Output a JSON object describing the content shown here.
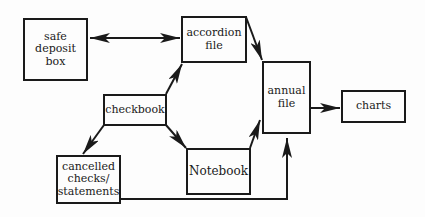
{
  "nodes": {
    "safe_deposit_box": {
      "label": "safe\ndeposit\nbox"
    },
    "accordion_file": {
      "label": "accordion\nfile"
    },
    "checkbook": {
      "label": "checkbook"
    },
    "cancelled_checks": {
      "label": "cancelled\nchecks/\nstatements"
    },
    "notebook": {
      "label": "Notebook"
    },
    "annual_file": {
      "label": "annual\nfile"
    },
    "charts": {
      "label": "charts"
    }
  },
  "edges": [
    {
      "from": "safe deposit box",
      "to": "accordion file",
      "bidirectional": true
    },
    {
      "from": "checkbook",
      "to": "accordion file"
    },
    {
      "from": "checkbook",
      "to": "cancelled checks/statements"
    },
    {
      "from": "checkbook",
      "to": "Notebook"
    },
    {
      "from": "accordion file",
      "to": "annual file"
    },
    {
      "from": "Notebook",
      "to": "annual file"
    },
    {
      "from": "cancelled checks/statements",
      "to": "annual file"
    },
    {
      "from": "annual file",
      "to": "charts"
    }
  ]
}
